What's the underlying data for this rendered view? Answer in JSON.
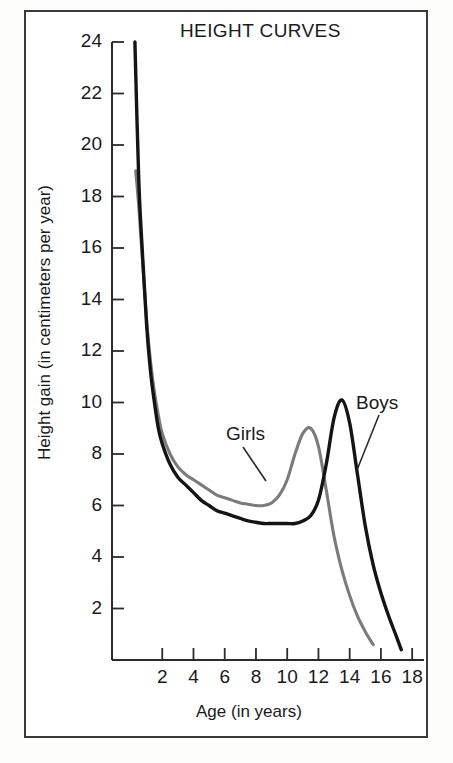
{
  "figure": {
    "title": "HEIGHT CURVES",
    "background_color": "#ffffff",
    "border_color": "#3a3a3a"
  },
  "axes": {
    "x_label": "Age (in years)",
    "y_label": "Height gain (in centimeters per year)",
    "x_ticks": [
      "2",
      "4",
      "6",
      "8",
      "10",
      "12",
      "14",
      "16",
      "18"
    ],
    "y_ticks": [
      "24",
      "22",
      "20",
      "18",
      "16",
      "14",
      "12",
      "10",
      "8",
      "6",
      "4",
      "2"
    ]
  },
  "series_labels": {
    "girls": "Girls",
    "boys": "Boys"
  },
  "colors": {
    "girls": "#7b7b7b",
    "boys": "#141414",
    "axis": "#2b2b2b"
  },
  "chart_data": {
    "type": "line",
    "title": "HEIGHT CURVES",
    "xlabel": "Age (in years)",
    "ylabel": "Height gain (in centimeters per year)",
    "xlim": [
      0,
      18
    ],
    "ylim": [
      0,
      24
    ],
    "xticks": [
      2,
      4,
      6,
      8,
      10,
      12,
      14,
      16,
      18
    ],
    "yticks": [
      2,
      4,
      6,
      8,
      10,
      12,
      14,
      16,
      18,
      20,
      22,
      24
    ],
    "grid": false,
    "legend": "inline-annotations",
    "annotations": [
      {
        "text": "Girls",
        "points_to_x": 10.6,
        "points_to_y": 6.1
      },
      {
        "text": "Boys",
        "points_to_x": 14.4,
        "points_to_y": 7.6
      }
    ],
    "series": [
      {
        "name": "Girls",
        "color": "#7b7b7b",
        "peak": {
          "age": 11.5,
          "gain": 9.0
        },
        "x": [
          0.3,
          0.5,
          0.75,
          1.0,
          1.25,
          1.5,
          1.75,
          2.0,
          2.5,
          3.0,
          3.5,
          4.0,
          4.5,
          5.0,
          5.5,
          6.0,
          6.5,
          7.0,
          7.5,
          8.0,
          8.5,
          9.0,
          9.5,
          10.0,
          10.5,
          11.0,
          11.5,
          12.0,
          12.5,
          13.0,
          13.5,
          14.0,
          14.5,
          15.0,
          15.5
        ],
        "y": [
          19.0,
          17.6,
          15.4,
          13.2,
          11.6,
          10.4,
          9.5,
          8.8,
          8.0,
          7.5,
          7.2,
          7.0,
          6.8,
          6.6,
          6.4,
          6.3,
          6.2,
          6.1,
          6.05,
          6.0,
          6.0,
          6.1,
          6.4,
          7.0,
          8.0,
          8.8,
          9.0,
          8.3,
          6.6,
          4.8,
          3.5,
          2.5,
          1.7,
          1.1,
          0.6
        ]
      },
      {
        "name": "Boys",
        "color": "#141414",
        "peak": {
          "age": 13.5,
          "gain": 10.1
        },
        "x": [
          0.25,
          0.5,
          0.75,
          1.0,
          1.25,
          1.5,
          1.75,
          2.0,
          2.5,
          3.0,
          3.5,
          4.0,
          4.5,
          5.0,
          5.5,
          6.0,
          6.5,
          7.0,
          7.5,
          8.0,
          8.5,
          9.0,
          9.5,
          10.0,
          10.5,
          11.0,
          11.5,
          12.0,
          12.5,
          13.0,
          13.5,
          14.0,
          14.5,
          15.0,
          15.5,
          16.0,
          16.5,
          17.0,
          17.3
        ],
        "y": [
          24.0,
          18.6,
          15.6,
          13.0,
          11.2,
          10.0,
          9.0,
          8.4,
          7.6,
          7.1,
          6.8,
          6.5,
          6.2,
          6.0,
          5.8,
          5.7,
          5.6,
          5.5,
          5.4,
          5.35,
          5.3,
          5.3,
          5.3,
          5.3,
          5.3,
          5.4,
          5.6,
          6.2,
          7.6,
          9.4,
          10.1,
          9.2,
          7.2,
          5.2,
          3.7,
          2.6,
          1.7,
          0.9,
          0.4
        ]
      }
    ]
  }
}
